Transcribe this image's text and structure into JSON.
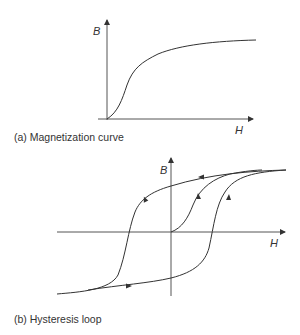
{
  "figures": [
    {
      "id": "a",
      "caption": "(a) Magnetization curve",
      "x_label": "H",
      "y_label": "B"
    },
    {
      "id": "b",
      "caption": "(b) Hysteresis loop",
      "x_label": "H",
      "y_label": "B"
    }
  ],
  "colors": {
    "line": "#333333",
    "axis": "#555555",
    "background": "#ffffff"
  }
}
